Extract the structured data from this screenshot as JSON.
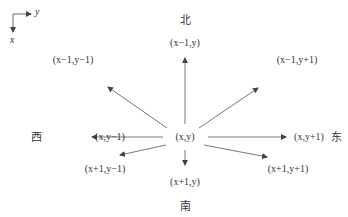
{
  "axes": {
    "horizontal": "y",
    "vertical": "x"
  },
  "directions": {
    "north": "北",
    "south": "南",
    "west": "西",
    "east": "东"
  },
  "center": "(x,y)",
  "neighbors": {
    "n": "(x−1,y)",
    "nw": "(x−1,y−1)",
    "ne": "(x−1,y+1)",
    "w": "(x,y−1)",
    "e": "(x,y+1)",
    "sw": "(x+1,y−1)",
    "s": "(x+1,y)",
    "se": "(x+1,y+1)"
  },
  "colors": {
    "arrow": "#555555",
    "text": "#333333"
  }
}
